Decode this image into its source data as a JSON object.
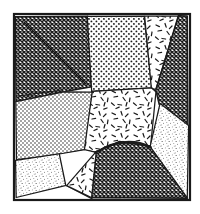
{
  "figure": {
    "title": "Hand-drawn tessellated pattern plate",
    "type": "line-art-diagram",
    "canvas": {
      "width": 200,
      "height": 214,
      "background": "#ffffff"
    },
    "frame": {
      "name": "outer-border",
      "x": 14,
      "y": 14,
      "width": 176,
      "height": 186,
      "stroke": "#1a1a1a",
      "stroke_width": 2.2,
      "fill": "#ffffff"
    },
    "ink_color": "#1b1b1b",
    "regions": [
      {
        "id": "r1",
        "name": "region-top-left-crosshatch",
        "pattern": "dense-crosshatch",
        "tone": "dark",
        "points": "16,16 88,16 92,86 64,92 16,101",
        "label": "A"
      },
      {
        "id": "r2",
        "name": "region-top-center-dots",
        "pattern": "coarse-dots",
        "tone": "mid",
        "points": "88,16 144,16 152,88 92,92",
        "label": "B"
      },
      {
        "id": "r3",
        "name": "region-top-right-dashes",
        "pattern": "short-dashes",
        "tone": "light",
        "points": "144,16 178,16 156,90 152,88",
        "label": "C"
      },
      {
        "id": "r4",
        "name": "region-right-crosshatch-wedge",
        "pattern": "dense-crosshatch",
        "tone": "dark",
        "points": "178,16 188,16 188,126 160,104 156,90",
        "label": "D"
      },
      {
        "id": "r5",
        "name": "region-center-dashes",
        "pattern": "short-dashes",
        "tone": "light",
        "points": "92,92 152,88 156,92 150,146 120,142 96,152 84,150",
        "label": "E"
      },
      {
        "id": "r6",
        "name": "region-left-fine-dots",
        "pattern": "fine-dots",
        "tone": "mid",
        "points": "16,101 64,92 92,92 84,150 60,154 16,160",
        "label": "F"
      },
      {
        "id": "r7",
        "name": "region-bottom-left-stipple",
        "pattern": "fine-stipple",
        "tone": "light",
        "points": "16,160 60,154 66,186 16,198",
        "label": "G"
      },
      {
        "id": "r8",
        "name": "region-bottom-center-white",
        "pattern": "blank",
        "tone": "white",
        "points": "60,154 84,150 96,152 92,198 66,186",
        "label": "H"
      },
      {
        "id": "r9",
        "name": "region-bottom-center-dashes",
        "pattern": "short-dashes",
        "tone": "light",
        "points": "66,186 92,198 120,198 112,168 96,152",
        "label": "I"
      },
      {
        "id": "r10",
        "name": "region-bottom-right-dome-crosshatch",
        "pattern": "dense-crosshatch",
        "tone": "dark",
        "points": "96,152 120,142 150,146 188,198 92,198",
        "label": "J",
        "rounded_top": true
      },
      {
        "id": "r11",
        "name": "region-right-lower-stipple",
        "pattern": "fine-stipple",
        "tone": "light",
        "points": "150,146 160,104 188,126 188,198",
        "label": "K"
      }
    ],
    "creases": [
      {
        "name": "crease-top-left-diagonal",
        "d": "M 24,22 L 86,84"
      },
      {
        "name": "crease-left-fold",
        "d": "M 18,96 L 62,90"
      },
      {
        "name": "crease-center-junction",
        "d": "M 152,88 L 158,94"
      },
      {
        "name": "crease-dome-arc",
        "d": "M 98,152 Q 124,136 150,148"
      }
    ],
    "junctions": [
      {
        "name": "junction-upper-right",
        "x": 155,
        "y": 90
      },
      {
        "name": "junction-center-left",
        "x": 92,
        "y": 92
      },
      {
        "name": "junction-lower-center",
        "x": 96,
        "y": 152
      }
    ]
  }
}
